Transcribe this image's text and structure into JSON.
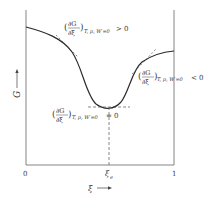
{
  "diagram": {
    "type": "gibbs-energy-vs-extent-of-reaction",
    "y_axis": {
      "label": "G",
      "arrow": "up"
    },
    "x_axis": {
      "label": "ξ",
      "arrow": "right",
      "ticks": [
        "0",
        "ξe",
        "1"
      ]
    },
    "tick_labels": {
      "start": "0",
      "equilibrium_main": "ξ",
      "equilibrium_sub": "e",
      "end": "1"
    },
    "annotations": {
      "left_slope": {
        "num": "∂G",
        "den": "∂ξ",
        "subscript": "T, p, W′=0",
        "relation": "> 0"
      },
      "right_slope": {
        "num": "∂G",
        "den": "∂ξ",
        "subscript": "T, p, W′=0",
        "relation": "< 0"
      },
      "minimum": {
        "num": "∂G",
        "den": "∂ξ",
        "subscript": "T, p, W′=0",
        "relation": "= 0"
      }
    },
    "colors": {
      "line": "#2a2a2a",
      "text": "#3a3a3a",
      "dashed": "#555555"
    }
  }
}
